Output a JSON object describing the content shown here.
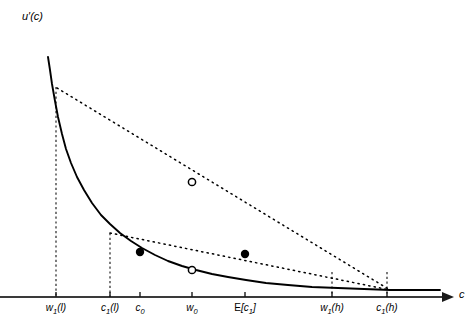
{
  "chart_data": {
    "type": "line",
    "title": "",
    "xlabel": "c",
    "ylabel": "u'(c)",
    "grid": false,
    "legend": false,
    "axes": {
      "origin_px": [
        27,
        297
      ],
      "x_axis_end_px": [
        455,
        297
      ],
      "y_axis_top_px": [
        27,
        25
      ],
      "x_arrow": true,
      "y_arrow": true
    },
    "xticks": [
      {
        "label_html": "w<sub>1</sub>(l)",
        "x_px": 56
      },
      {
        "label_html": "c<sub>1</sub>(l)",
        "x_px": 110
      },
      {
        "label_html": "c<sub>0</sub>",
        "x_px": 140
      },
      {
        "label_html": "w<sub>0</sub>",
        "x_px": 192
      },
      {
        "label_html": "E[c<sub>1</sub>]",
        "x_px": 245
      },
      {
        "label_html": "w<sub>1</sub>(h)",
        "x_px": 332
      },
      {
        "label_html": "c<sub>1</sub>(h)",
        "x_px": 387
      }
    ],
    "series": [
      {
        "name": "marginal-utility-curve",
        "style": "solid",
        "color": "#000000",
        "points": [
          [
            48,
            57
          ],
          [
            50,
            70
          ],
          [
            52,
            84
          ],
          [
            55,
            101
          ],
          [
            58,
            117
          ],
          [
            62,
            134
          ],
          [
            66,
            149
          ],
          [
            71,
            163
          ],
          [
            77,
            177
          ],
          [
            84,
            190
          ],
          [
            92,
            203
          ],
          [
            101,
            215
          ],
          [
            110,
            224
          ],
          [
            120,
            233
          ],
          [
            131,
            241
          ],
          [
            142,
            248
          ],
          [
            155,
            255
          ],
          [
            168,
            261
          ],
          [
            182,
            266
          ],
          [
            196,
            270
          ],
          [
            212,
            274
          ],
          [
            228,
            277
          ],
          [
            246,
            280
          ],
          [
            266,
            283
          ],
          [
            288,
            285
          ],
          [
            312,
            287
          ],
          [
            338,
            288
          ],
          [
            364,
            289
          ],
          [
            390,
            290
          ],
          [
            416,
            290
          ],
          [
            440,
            290
          ]
        ]
      },
      {
        "name": "upper-chord-high-risk",
        "style": "dotted",
        "color": "#000000",
        "points": [
          [
            57,
            88
          ],
          [
            390,
            290
          ]
        ]
      },
      {
        "name": "lower-chord-low-risk",
        "style": "dotted",
        "color": "#000000",
        "points": [
          [
            110,
            233
          ],
          [
            390,
            290
          ]
        ]
      }
    ],
    "vertical_dashed_lines": [
      {
        "name": "w1-low-dropline",
        "x_px": 56,
        "y_top_px": 87,
        "y_bottom_px": 297
      },
      {
        "name": "c1-low-dropline",
        "x_px": 110,
        "y_top_px": 233,
        "y_bottom_px": 297
      },
      {
        "name": "w1-high-dropline",
        "x_px": 332,
        "y_top_px": 272,
        "y_bottom_px": 297
      },
      {
        "name": "c1-high-dropline",
        "x_px": 387,
        "y_top_px": 272,
        "y_bottom_px": 297
      }
    ],
    "markers": [
      {
        "name": "expected-marginal-utility-high",
        "type": "open-circle",
        "x_px": 192,
        "y_px": 182
      },
      {
        "name": "marginal-utility-at-c0",
        "type": "filled-dot",
        "x_px": 140,
        "y_px": 252
      },
      {
        "name": "marginal-utility-at-expected-c1",
        "type": "filled-dot",
        "x_px": 245,
        "y_px": 254
      },
      {
        "name": "marginal-utility-at-w0",
        "type": "open-circle",
        "x_px": 192,
        "y_px": 270
      }
    ]
  },
  "labels": {
    "y_axis": "u′(c)",
    "x_axis": "c"
  },
  "colors": {
    "line": "#000000",
    "axis": "#1a1a1a",
    "background": "#ffffff"
  }
}
